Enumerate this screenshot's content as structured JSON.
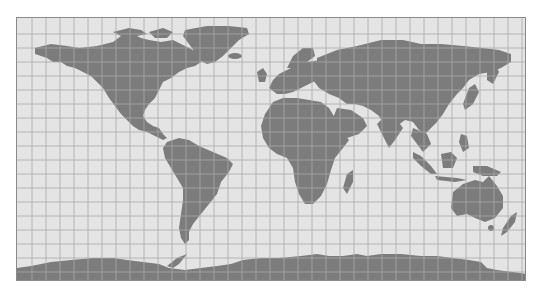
{
  "map": {
    "title": "World map",
    "projection": "equirectangular-like",
    "style": "grayscale",
    "colors": {
      "background": "#ffffff",
      "ocean": "#e4e4e4",
      "land": "#7c7c7c",
      "grid": "#a8a8a8",
      "frame": "#8a8a8a"
    },
    "grid": {
      "spacing_px": 14,
      "columns": 36,
      "rows": 19
    },
    "frame": {
      "x": 16,
      "y": 17,
      "width": 510,
      "height": 264
    },
    "landmasses": [
      "North America",
      "Greenland",
      "South America",
      "Europe",
      "Africa",
      "Asia",
      "Arabian Peninsula",
      "Madagascar",
      "Japan",
      "Indonesia",
      "Australia",
      "New Zealand",
      "Antarctica"
    ]
  }
}
